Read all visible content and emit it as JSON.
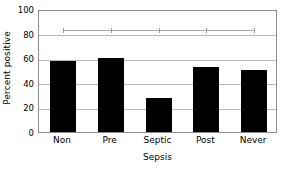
{
  "chart_data": {
    "type": "bar",
    "title": "",
    "xlabel": "Sepsis",
    "ylabel": "Percent positive",
    "categories": [
      "Non",
      "Pre",
      "Septic",
      "Post",
      "Never"
    ],
    "values": [
      58,
      60,
      28,
      52.5,
      50.5
    ],
    "series": [
      {
        "name": "Percent positive",
        "type": "bar",
        "values": [
          58,
          60,
          28,
          52.5,
          50.5
        ],
        "color": "#000000"
      },
      {
        "name": "reference-line",
        "type": "line",
        "values": [
          84,
          84,
          84,
          84,
          84
        ],
        "color": "#aaaaaa"
      }
    ],
    "ylim": [
      0,
      100
    ],
    "yticks": [
      0,
      20,
      40,
      60,
      80,
      100
    ],
    "ytick_labels": [
      "0",
      "20",
      "40",
      "60",
      "80",
      "100"
    ],
    "grid": true,
    "grid_axis": "y",
    "legend": "none",
    "legend_position": "none",
    "bar_color": "#000000",
    "grid_color": "#b9b9b9",
    "axis_color": "#8d8d8d",
    "background": "#ffffff"
  }
}
